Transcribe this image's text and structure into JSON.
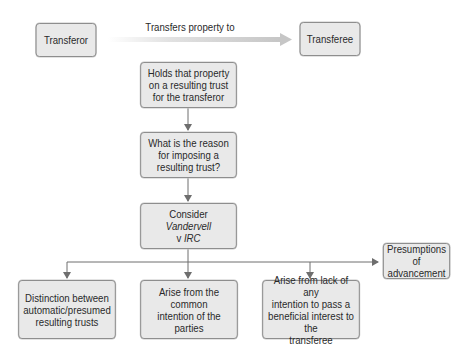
{
  "diagram": {
    "top_row": {
      "transferor": "Transferor",
      "arrow_label": "Transfers property to",
      "transferee": "Transferee"
    },
    "flow": {
      "holds": [
        "Holds that property",
        "on a resulting trust",
        "for the transferor"
      ],
      "reason": [
        "What is the reason",
        "for imposing a",
        "resulting trust?"
      ],
      "consider": {
        "line1": "Consider",
        "line2_italic": "Vandervell",
        "line3_prefix": "v ",
        "line3_italic": "IRC"
      }
    },
    "branches": {
      "distinction": [
        "Distinction between",
        "automatic/presumed",
        "resulting trusts"
      ],
      "common_intention": [
        "Arise from the common",
        "intention of the parties"
      ],
      "lack_of_intention": [
        "Arise from lack of any",
        "intention to pass a",
        "beneficial interest to the",
        "transferee"
      ],
      "presumptions": [
        "Presumptions of",
        "advancement"
      ]
    },
    "colors": {
      "box_fill": "#e9e9e9",
      "box_border": "#8a8a8a",
      "connector": "#6e6e6e",
      "transfer_arrow_start": "#ffffff",
      "transfer_arrow_end": "#c6c6c6"
    }
  }
}
